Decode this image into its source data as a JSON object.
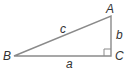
{
  "diagram": {
    "type": "right-triangle",
    "vertices": {
      "A": {
        "label": "A",
        "x": 111,
        "y": 16
      },
      "B": {
        "label": "B",
        "x": 14,
        "y": 56
      },
      "C": {
        "label": "C",
        "x": 111,
        "y": 56
      }
    },
    "sides": {
      "a": {
        "label": "a",
        "between": [
          "B",
          "C"
        ]
      },
      "b": {
        "label": "b",
        "between": [
          "A",
          "C"
        ]
      },
      "c": {
        "label": "c",
        "between": [
          "A",
          "B"
        ]
      }
    },
    "right_angle_at": "C",
    "line_color": "#888888",
    "label_color": "#333333"
  }
}
